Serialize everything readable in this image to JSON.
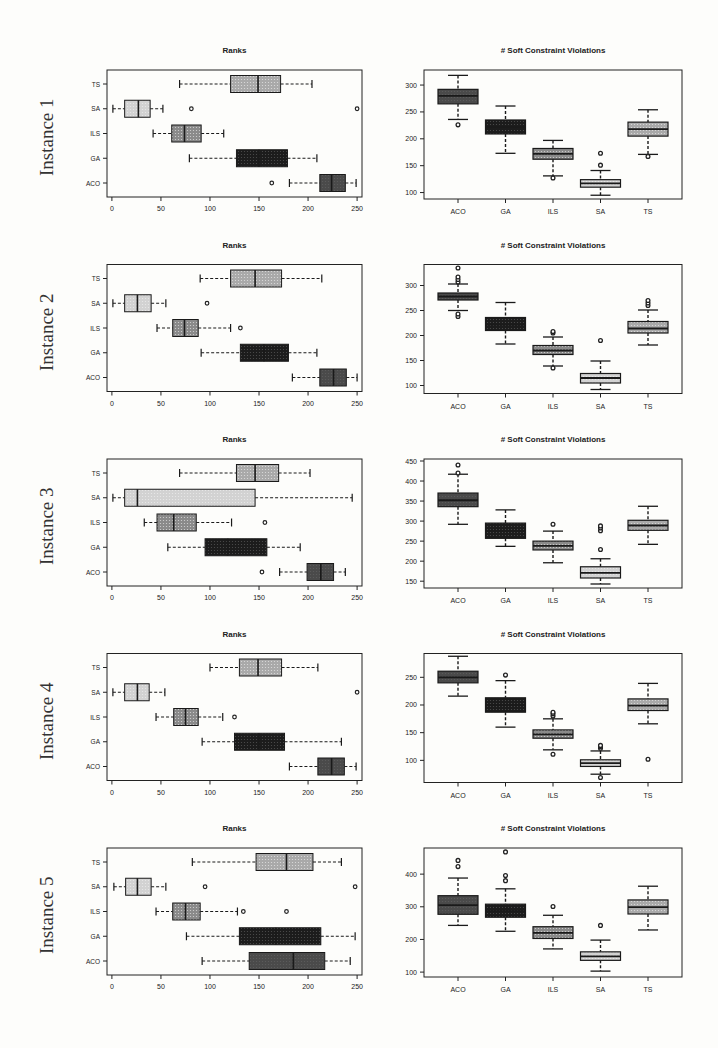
{
  "figure": {
    "left_title": "Ranks",
    "right_title": "# Soft Constraint Violations"
  },
  "chart_data": [
    {
      "panel": "Instance 1 - Ranks",
      "type": "boxplot",
      "orientation": "horizontal",
      "row_label": "Instance 1",
      "title": "Ranks",
      "categories": [
        "ACO",
        "GA",
        "ILS",
        "SA",
        "TS"
      ],
      "xticks": [
        0,
        50,
        100,
        150,
        200,
        250
      ],
      "xlim": [
        -5,
        255
      ],
      "boxes": {
        "ACO": {
          "min": 181,
          "q1": 212,
          "median": 224,
          "q3": 238,
          "max": 249,
          "outliers": [
            163
          ]
        },
        "GA": {
          "min": 79,
          "q1": 127,
          "median": 150,
          "q3": 179,
          "max": 209,
          "outliers": []
        },
        "ILS": {
          "min": 42,
          "q1": 61,
          "median": 74,
          "q3": 91,
          "max": 114,
          "outliers": []
        },
        "SA": {
          "min": 1,
          "q1": 13,
          "median": 27,
          "q3": 39,
          "max": 52,
          "outliers": [
            81,
            250
          ]
        },
        "TS": {
          "min": 69,
          "q1": 121,
          "median": 149,
          "q3": 172,
          "max": 204,
          "outliers": []
        }
      }
    },
    {
      "panel": "Instance 1 - Soft Constraint Violations",
      "type": "boxplot",
      "orientation": "vertical",
      "title": "# Soft Constraint Violations",
      "categories": [
        "ACO",
        "GA",
        "ILS",
        "SA",
        "TS"
      ],
      "yticks": [
        100,
        150,
        200,
        250,
        300
      ],
      "ylim": [
        88,
        328
      ],
      "boxes": {
        "ACO": {
          "min": 236,
          "q1": 265,
          "median": 280,
          "q3": 292,
          "max": 318,
          "outliers": [
            226
          ]
        },
        "GA": {
          "min": 173,
          "q1": 209,
          "median": 222,
          "q3": 235,
          "max": 261,
          "outliers": []
        },
        "ILS": {
          "min": 131,
          "q1": 162,
          "median": 172,
          "q3": 182,
          "max": 197,
          "outliers": [
            127
          ]
        },
        "SA": {
          "min": 95,
          "q1": 110,
          "median": 117,
          "q3": 124,
          "max": 141,
          "outliers": [
            151,
            173
          ]
        },
        "TS": {
          "min": 171,
          "q1": 205,
          "median": 218,
          "q3": 231,
          "max": 254,
          "outliers": [
            167
          ]
        }
      }
    },
    {
      "panel": "Instance 2 - Ranks",
      "type": "boxplot",
      "orientation": "horizontal",
      "row_label": "Instance 2",
      "title": "Ranks",
      "categories": [
        "ACO",
        "GA",
        "ILS",
        "SA",
        "TS"
      ],
      "xticks": [
        0,
        50,
        100,
        150,
        200,
        250
      ],
      "xlim": [
        -5,
        255
      ],
      "boxes": {
        "ACO": {
          "min": 184,
          "q1": 212,
          "median": 226,
          "q3": 239,
          "max": 250,
          "outliers": []
        },
        "GA": {
          "min": 91,
          "q1": 131,
          "median": 155,
          "q3": 180,
          "max": 209,
          "outliers": []
        },
        "ILS": {
          "min": 46,
          "q1": 62,
          "median": 74,
          "q3": 88,
          "max": 121,
          "outliers": [
            131
          ]
        },
        "SA": {
          "min": 1,
          "q1": 13,
          "median": 26,
          "q3": 40,
          "max": 55,
          "outliers": [
            97
          ]
        },
        "TS": {
          "min": 90,
          "q1": 121,
          "median": 146,
          "q3": 173,
          "max": 214,
          "outliers": []
        }
      }
    },
    {
      "panel": "Instance 2 - Soft Constraint Violations",
      "type": "boxplot",
      "orientation": "vertical",
      "title": "# Soft Constraint Violations",
      "categories": [
        "ACO",
        "GA",
        "ILS",
        "SA",
        "TS"
      ],
      "yticks": [
        100,
        150,
        200,
        250,
        300
      ],
      "ylim": [
        84,
        342
      ],
      "boxes": {
        "ACO": {
          "min": 250,
          "q1": 271,
          "median": 278,
          "q3": 285,
          "max": 303,
          "outliers": [
            238,
            243,
            307,
            312,
            317,
            335
          ]
        },
        "GA": {
          "min": 183,
          "q1": 210,
          "median": 222,
          "q3": 236,
          "max": 266,
          "outliers": []
        },
        "ILS": {
          "min": 139,
          "q1": 162,
          "median": 170,
          "q3": 180,
          "max": 197,
          "outliers": [
            135,
            205,
            208
          ]
        },
        "SA": {
          "min": 92,
          "q1": 105,
          "median": 115,
          "q3": 124,
          "max": 149,
          "outliers": [
            190
          ]
        },
        "TS": {
          "min": 181,
          "q1": 205,
          "median": 214,
          "q3": 228,
          "max": 251,
          "outliers": [
            260,
            265,
            270
          ]
        }
      }
    },
    {
      "panel": "Instance 3 - Ranks",
      "type": "boxplot",
      "orientation": "horizontal",
      "row_label": "Instance 3",
      "title": "Ranks",
      "categories": [
        "ACO",
        "GA",
        "ILS",
        "SA",
        "TS"
      ],
      "xticks": [
        0,
        50,
        100,
        150,
        200,
        250
      ],
      "xlim": [
        -5,
        255
      ],
      "boxes": {
        "ACO": {
          "min": 171,
          "q1": 199,
          "median": 213,
          "q3": 226,
          "max": 238,
          "outliers": [
            153
          ]
        },
        "GA": {
          "min": 57,
          "q1": 95,
          "median": 118,
          "q3": 158,
          "max": 192,
          "outliers": []
        },
        "ILS": {
          "min": 33,
          "q1": 46,
          "median": 63,
          "q3": 86,
          "max": 122,
          "outliers": [
            156
          ]
        },
        "SA": {
          "min": 1,
          "q1": 13,
          "median": 26,
          "q3": 146,
          "max": 245,
          "outliers": []
        },
        "TS": {
          "min": 69,
          "q1": 127,
          "median": 146,
          "q3": 170,
          "max": 202,
          "outliers": []
        }
      }
    },
    {
      "panel": "Instance 3 - Soft Constraint Violations",
      "type": "boxplot",
      "orientation": "vertical",
      "title": "# Soft Constraint Violations",
      "categories": [
        "ACO",
        "GA",
        "ILS",
        "SA",
        "TS"
      ],
      "yticks": [
        150,
        200,
        250,
        300,
        350,
        400,
        450
      ],
      "ylim": [
        133,
        455
      ],
      "boxes": {
        "ACO": {
          "min": 292,
          "q1": 336,
          "median": 352,
          "q3": 370,
          "max": 417,
          "outliers": [
            420,
            440
          ]
        },
        "GA": {
          "min": 237,
          "q1": 257,
          "median": 275,
          "q3": 295,
          "max": 328,
          "outliers": []
        },
        "ILS": {
          "min": 196,
          "q1": 228,
          "median": 238,
          "q3": 250,
          "max": 275,
          "outliers": [
            292
          ]
        },
        "SA": {
          "min": 143,
          "q1": 158,
          "median": 171,
          "q3": 186,
          "max": 206,
          "outliers": [
            229,
            276,
            283,
            288
          ]
        },
        "TS": {
          "min": 242,
          "q1": 277,
          "median": 289,
          "q3": 302,
          "max": 337,
          "outliers": []
        }
      }
    },
    {
      "panel": "Instance 4 - Ranks",
      "type": "boxplot",
      "orientation": "horizontal",
      "row_label": "Instance 4",
      "title": "Ranks",
      "categories": [
        "ACO",
        "GA",
        "ILS",
        "SA",
        "TS"
      ],
      "xticks": [
        0,
        50,
        100,
        150,
        200,
        250
      ],
      "xlim": [
        -5,
        255
      ],
      "boxes": {
        "ACO": {
          "min": 181,
          "q1": 210,
          "median": 224,
          "q3": 237,
          "max": 249,
          "outliers": []
        },
        "GA": {
          "min": 92,
          "q1": 125,
          "median": 150,
          "q3": 176,
          "max": 234,
          "outliers": []
        },
        "ILS": {
          "min": 45,
          "q1": 63,
          "median": 75,
          "q3": 88,
          "max": 113,
          "outliers": [
            125
          ]
        },
        "SA": {
          "min": 1,
          "q1": 13,
          "median": 26,
          "q3": 38,
          "max": 54,
          "outliers": [
            250
          ]
        },
        "TS": {
          "min": 100,
          "q1": 130,
          "median": 149,
          "q3": 173,
          "max": 210,
          "outliers": []
        }
      }
    },
    {
      "panel": "Instance 4 - Soft Constraint Violations",
      "type": "boxplot",
      "orientation": "vertical",
      "title": "# Soft Constraint Violations",
      "categories": [
        "ACO",
        "GA",
        "ILS",
        "SA",
        "TS"
      ],
      "yticks": [
        100,
        150,
        200,
        250
      ],
      "ylim": [
        60,
        293
      ],
      "boxes": {
        "ACO": {
          "min": 216,
          "q1": 240,
          "median": 250,
          "q3": 261,
          "max": 288,
          "outliers": []
        },
        "GA": {
          "min": 160,
          "q1": 187,
          "median": 200,
          "q3": 213,
          "max": 244,
          "outliers": [
            254
          ]
        },
        "ILS": {
          "min": 119,
          "q1": 140,
          "median": 147,
          "q3": 155,
          "max": 175,
          "outliers": [
            111,
            180,
            184,
            187
          ]
        },
        "SA": {
          "min": 75,
          "q1": 89,
          "median": 95,
          "q3": 101,
          "max": 117,
          "outliers": [
            69,
            122,
            125,
            127
          ]
        },
        "TS": {
          "min": 166,
          "q1": 190,
          "median": 199,
          "q3": 211,
          "max": 239,
          "outliers": [
            102
          ]
        }
      }
    },
    {
      "panel": "Instance 5 - Ranks",
      "type": "boxplot",
      "orientation": "horizontal",
      "row_label": "Instance 5",
      "title": "Ranks",
      "categories": [
        "ACO",
        "GA",
        "ILS",
        "SA",
        "TS"
      ],
      "xticks": [
        0,
        50,
        100,
        150,
        200,
        250
      ],
      "xlim": [
        -5,
        255
      ],
      "boxes": {
        "ACO": {
          "min": 92,
          "q1": 140,
          "median": 185,
          "q3": 217,
          "max": 243,
          "outliers": []
        },
        "GA": {
          "min": 76,
          "q1": 130,
          "median": 167,
          "q3": 213,
          "max": 248,
          "outliers": []
        },
        "ILS": {
          "min": 45,
          "q1": 62,
          "median": 75,
          "q3": 90,
          "max": 128,
          "outliers": [
            134,
            178
          ]
        },
        "SA": {
          "min": 2,
          "q1": 14,
          "median": 26,
          "q3": 40,
          "max": 55,
          "outliers": [
            95,
            248
          ]
        },
        "TS": {
          "min": 82,
          "q1": 147,
          "median": 178,
          "q3": 205,
          "max": 234,
          "outliers": []
        }
      }
    },
    {
      "panel": "Instance 5 - Soft Constraint Violations",
      "type": "boxplot",
      "orientation": "vertical",
      "title": "# Soft Constraint Violations",
      "categories": [
        "ACO",
        "GA",
        "ILS",
        "SA",
        "TS"
      ],
      "yticks": [
        100,
        200,
        300,
        400
      ],
      "ylim": [
        85,
        480
      ],
      "boxes": {
        "ACO": {
          "min": 243,
          "q1": 277,
          "median": 305,
          "q3": 334,
          "max": 388,
          "outliers": [
            423,
            442
          ]
        },
        "GA": {
          "min": 225,
          "q1": 268,
          "median": 287,
          "q3": 308,
          "max": 355,
          "outliers": [
            380,
            396,
            468
          ]
        },
        "ILS": {
          "min": 171,
          "q1": 203,
          "median": 220,
          "q3": 239,
          "max": 274,
          "outliers": [
            301
          ]
        },
        "SA": {
          "min": 103,
          "q1": 136,
          "median": 148,
          "q3": 162,
          "max": 198,
          "outliers": [
            243
          ]
        },
        "TS": {
          "min": 229,
          "q1": 278,
          "median": 299,
          "q3": 321,
          "max": 363,
          "outliers": []
        }
      }
    }
  ],
  "styles": {
    "fill": {
      "ACO": "#4a4a4a",
      "GA": "#1c1c1c",
      "ILS": "#8a8a8a",
      "SA": "#d2d2d2",
      "TS": "#a9a9a9"
    },
    "stroke": "#1a1a1a"
  }
}
